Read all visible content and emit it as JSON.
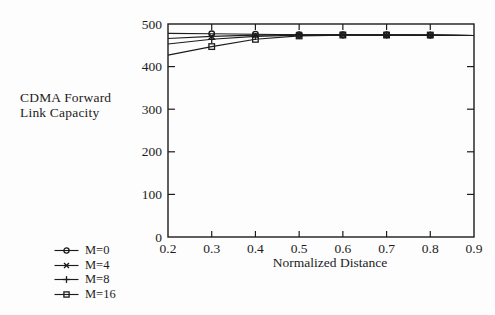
{
  "figure": {
    "ylabel_line1": "CDMA Forward",
    "ylabel_line2": "Link Capacity",
    "xlabel": "Normalized Distance"
  },
  "legend": {
    "items": [
      {
        "label": "M=0",
        "marker": "circle"
      },
      {
        "label": "M=4",
        "marker": "x"
      },
      {
        "label": "M=8",
        "marker": "plus"
      },
      {
        "label": "M=16",
        "marker": "square"
      }
    ]
  },
  "colors": {
    "ink": "#1c1c1c",
    "background": "#fdfdfd"
  },
  "chart_data": {
    "type": "line",
    "xlabel": "Normalized Distance",
    "ylabel": "CDMA Forward Link Capacity",
    "x": [
      0.2,
      0.3,
      0.4,
      0.5,
      0.6,
      0.7,
      0.8,
      0.9
    ],
    "xlim": [
      0.2,
      0.9
    ],
    "ylim": [
      0,
      500
    ],
    "xticks": [
      "0.2",
      "0.3",
      "0.4",
      "0.5",
      "0.6",
      "0.7",
      "0.8",
      "0.9"
    ],
    "yticks": [
      "0",
      "100",
      "200",
      "300",
      "400",
      "500"
    ],
    "grid": false,
    "legend_position": "outside-bottom-left",
    "marker_x_range": [
      0.3,
      0.8
    ],
    "series": [
      {
        "name": "M=0",
        "marker": "circle",
        "values": [
          478,
          477,
          476,
          475,
          475,
          475,
          474,
          473
        ]
      },
      {
        "name": "M=4",
        "marker": "x",
        "values": [
          466,
          471,
          474,
          475,
          475,
          474,
          474,
          473
        ]
      },
      {
        "name": "M=8",
        "marker": "plus",
        "values": [
          453,
          464,
          471,
          474,
          474,
          474,
          474,
          473
        ]
      },
      {
        "name": "M=16",
        "marker": "square",
        "values": [
          427,
          447,
          464,
          472,
          474,
          474,
          474,
          473
        ]
      }
    ]
  }
}
